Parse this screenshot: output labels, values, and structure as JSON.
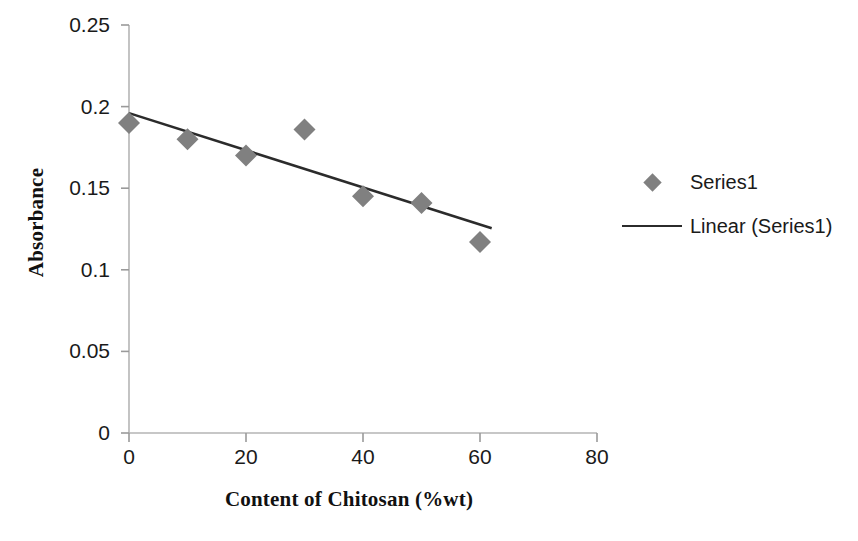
{
  "chart_data": {
    "type": "scatter",
    "title": "",
    "xlabel": "Content of Chitosan (%wt)",
    "ylabel": "Absorbance",
    "xlim": [
      0,
      80
    ],
    "ylim": [
      0,
      0.25
    ],
    "xticks": [
      0,
      20,
      40,
      60,
      80
    ],
    "xtick_labels": [
      "0",
      "20",
      "40",
      "60",
      "80"
    ],
    "yticks": [
      0,
      0.05,
      0.1,
      0.15,
      0.2,
      0.25
    ],
    "ytick_labels": [
      "0",
      "0.05",
      "0.1",
      "0.15",
      "0.2",
      "0.25"
    ],
    "grid": false,
    "legend_position": "right",
    "marker": "diamond",
    "marker_color": "#808080",
    "line_color": "#2b2b2b",
    "series": [
      {
        "name": "Series1",
        "kind": "scatter",
        "x": [
          0,
          10,
          20,
          30,
          40,
          50,
          60
        ],
        "y": [
          0.19,
          0.18,
          0.17,
          0.186,
          0.145,
          0.141,
          0.117
        ]
      },
      {
        "name": "Linear (Series1)",
        "kind": "trendline",
        "x": [
          0,
          62
        ],
        "y": [
          0.196,
          0.1255
        ]
      }
    ],
    "legend": [
      {
        "label": "Series1",
        "key": "diamond-marker",
        "color": "#808080"
      },
      {
        "label": "Linear (Series1)",
        "key": "line-swatch",
        "color": "#2b2b2b"
      }
    ]
  },
  "axis": {
    "y_title": "Absorbance",
    "x_title": "Content of Chitosan (%wt)"
  }
}
